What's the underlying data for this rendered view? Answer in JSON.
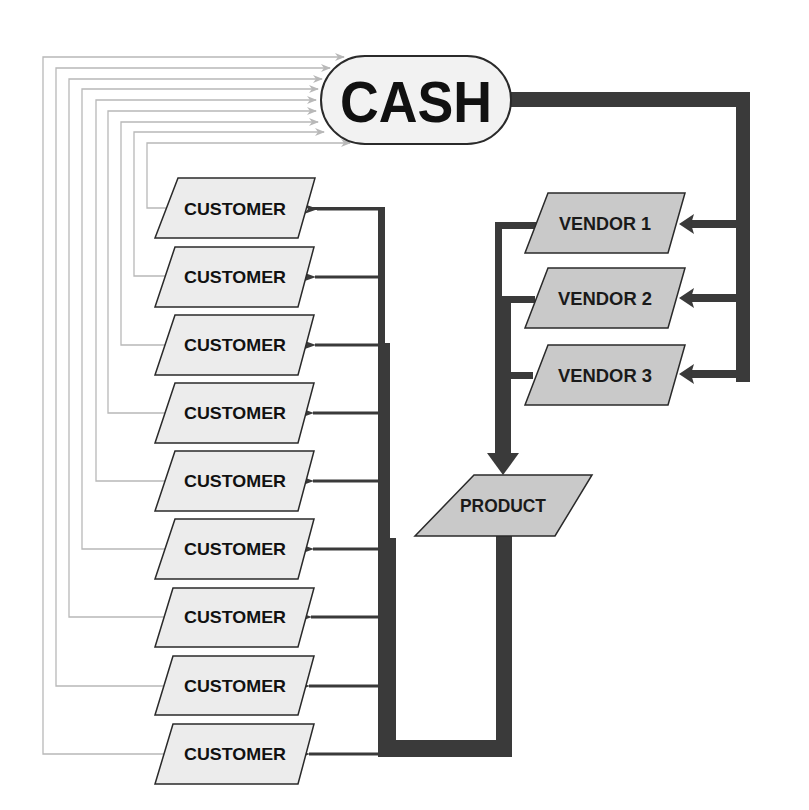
{
  "diagram": {
    "type": "flow",
    "colors": {
      "flow_thick": "#3a3a3a",
      "return_line": "#b8b8b8",
      "customer_fill": "#ececec",
      "vendor_fill": "#c9c9c9",
      "cash_fill": "#f2f2f2",
      "outline": "#2a2a2a"
    },
    "cash": {
      "label": "CASH"
    },
    "vendors": [
      {
        "label": "VENDOR 1"
      },
      {
        "label": "VENDOR 2"
      },
      {
        "label": "VENDOR 3"
      }
    ],
    "product": {
      "label": "PRODUCT"
    },
    "customers": [
      {
        "label": "CUSTOMER"
      },
      {
        "label": "CUSTOMER"
      },
      {
        "label": "CUSTOMER"
      },
      {
        "label": "CUSTOMER"
      },
      {
        "label": "CUSTOMER"
      },
      {
        "label": "CUSTOMER"
      },
      {
        "label": "CUSTOMER"
      },
      {
        "label": "CUSTOMER"
      },
      {
        "label": "CUSTOMER"
      }
    ],
    "edges": [
      {
        "from": "CASH",
        "to": "VENDOR 1"
      },
      {
        "from": "CASH",
        "to": "VENDOR 2"
      },
      {
        "from": "CASH",
        "to": "VENDOR 3"
      },
      {
        "from": "VENDOR 1",
        "to": "PRODUCT"
      },
      {
        "from": "VENDOR 2",
        "to": "PRODUCT"
      },
      {
        "from": "VENDOR 3",
        "to": "PRODUCT"
      },
      {
        "from": "PRODUCT",
        "to": "CUSTOMER (x9)"
      },
      {
        "from": "CUSTOMER (x9)",
        "to": "CASH"
      }
    ]
  }
}
